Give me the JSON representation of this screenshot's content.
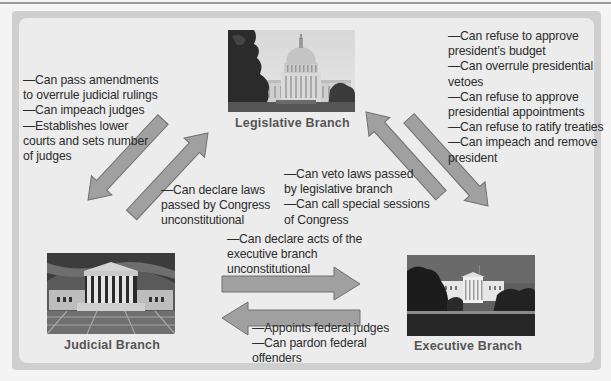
{
  "diagram": {
    "branches": {
      "legislative": {
        "label": "Legislative Branch",
        "image": "capitol-building-photo"
      },
      "judicial": {
        "label": "Judicial Branch",
        "image": "supreme-court-photo"
      },
      "executive": {
        "label": "Executive Branch",
        "image": "white-house-photo"
      }
    },
    "checks": {
      "legislative_on_judicial": [
        "—Can pass amendments",
        "to overrule judicial rulings",
        "—Can impeach judges",
        "—Establishes lower",
        "courts and sets number",
        "of judges"
      ],
      "legislative_on_executive": [
        "—Can refuse to approve",
        "president’s budget",
        "—Can overrule presidential",
        "vetoes",
        "—Can refuse to approve",
        "presidential appointments",
        "—Can refuse to ratify treaties",
        "—Can impeach and remove",
        "president"
      ],
      "judicial_on_legislative": [
        "—Can declare laws",
        "passed by Congress",
        "unconstitutional"
      ],
      "executive_on_legislative": [
        "—Can veto laws passed",
        "by legislative branch",
        "—Can call special sessions",
        "of Congress"
      ],
      "judicial_on_executive": [
        "—Can declare acts of the",
        "executive branch",
        "unconstitutional"
      ],
      "executive_on_judicial": [
        "—Appoints federal judges",
        "—Can pardon federal",
        "offenders"
      ]
    },
    "colors": {
      "arrow_fill": "#9e9e9e",
      "arrow_stroke": "#6e6e6e",
      "panel_bg": "#ececec",
      "frame": "#cfcfcf",
      "label_text": "#555555"
    }
  }
}
